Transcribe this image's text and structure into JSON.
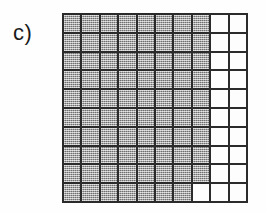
{
  "figure": {
    "panel_label": "c)",
    "background_color": "#fefefe"
  },
  "colors": {
    "grid_line": "#2b2b2b",
    "filled_cell": "#9d9d9d",
    "empty_cell": "#fdfdfd",
    "label_text": "#1a1a1a"
  },
  "chart_data": {
    "type": "heatmap",
    "title": "c)",
    "xlabel": "",
    "ylabel": "",
    "rows": 10,
    "columns": 10,
    "grid": true,
    "legend": [],
    "value_labels": {
      "1": "filled",
      "0": "empty"
    },
    "values": [
      [
        1,
        1,
        1,
        1,
        1,
        1,
        1,
        1,
        0,
        0
      ],
      [
        1,
        1,
        1,
        1,
        1,
        1,
        1,
        1,
        0,
        0
      ],
      [
        1,
        1,
        1,
        1,
        1,
        1,
        1,
        1,
        0,
        0
      ],
      [
        1,
        1,
        1,
        1,
        1,
        1,
        1,
        1,
        0,
        0
      ],
      [
        1,
        1,
        1,
        1,
        1,
        1,
        1,
        1,
        0,
        0
      ],
      [
        1,
        1,
        1,
        1,
        1,
        1,
        1,
        1,
        0,
        0
      ],
      [
        1,
        1,
        1,
        1,
        1,
        1,
        1,
        1,
        0,
        0
      ],
      [
        1,
        1,
        1,
        1,
        1,
        1,
        1,
        1,
        0,
        0
      ],
      [
        1,
        1,
        1,
        1,
        1,
        1,
        1,
        1,
        0,
        0
      ],
      [
        1,
        1,
        1,
        1,
        1,
        1,
        1,
        0,
        0,
        0
      ]
    ],
    "filled_count": 79,
    "empty_count": 21
  }
}
